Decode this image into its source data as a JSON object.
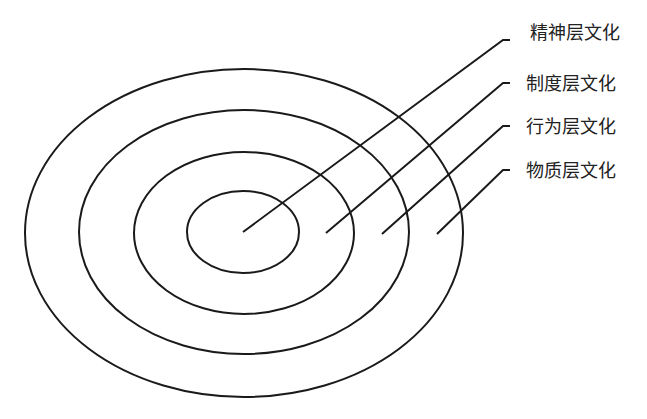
{
  "diagram": {
    "type": "concentric-layers",
    "stroke_color": "#1a1a1a",
    "layers": [
      {
        "label": "精神层文化",
        "level": "innermost"
      },
      {
        "label": "制度层文化",
        "level": "second"
      },
      {
        "label": "行为层文化",
        "level": "third"
      },
      {
        "label": "物质层文化",
        "level": "outermost"
      }
    ]
  }
}
